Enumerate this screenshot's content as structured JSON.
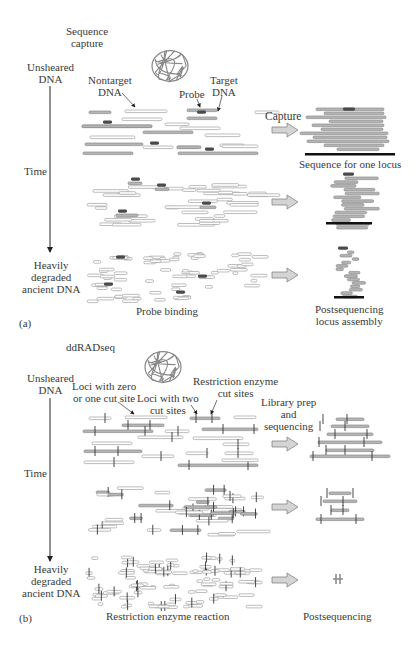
{
  "panel_a": {
    "title": "Sequence capture",
    "title_lines": [
      "Sequence",
      "capture"
    ],
    "panel_label": "(a)",
    "axis": {
      "top_label_lines": [
        "Unsheared",
        "DNA"
      ],
      "middle_label": "Time",
      "bottom_label_lines": [
        "Heavily",
        "degraded",
        "ancient DNA"
      ]
    },
    "annotations": {
      "nontarget_lines": [
        "Nontarget",
        "DNA"
      ],
      "probe": "Probe",
      "target_lines": [
        "Target",
        "DNA"
      ],
      "capture": "Capture"
    },
    "bottom_labels": {
      "left": "Probe binding",
      "right_lines": [
        "Postsequencing",
        "locus assembly"
      ]
    },
    "result_label": "Sequence for one locus",
    "colors": {
      "fragment_fill": "#ffffff",
      "fragment_stroke": "#a0a0a0",
      "target_fill": "#b5b5b5",
      "probe": "#4a4a4a",
      "locus_bar": "#111111",
      "arrow_fill": "#d4d4d4"
    }
  },
  "panel_b": {
    "title": "ddRADseq",
    "panel_label": "(b)",
    "axis": {
      "top_label_lines": [
        "Unsheared",
        "DNA"
      ],
      "middle_label": "Time",
      "bottom_label_lines": [
        "Heavily",
        "degraded",
        "ancient DNA"
      ]
    },
    "annotations": {
      "loci_zero_one_lines": [
        "Loci with zero",
        "or one cut site"
      ],
      "loci_two_lines": [
        "Loci with two",
        "cut sites"
      ],
      "restriction_lines": [
        "Restriction enzyme",
        "cut sites"
      ],
      "library_lines": [
        "Library prep",
        "and",
        "sequencing"
      ]
    },
    "bottom_labels": {
      "left": "Restriction enzyme reaction",
      "right": "Postsequencing"
    }
  }
}
